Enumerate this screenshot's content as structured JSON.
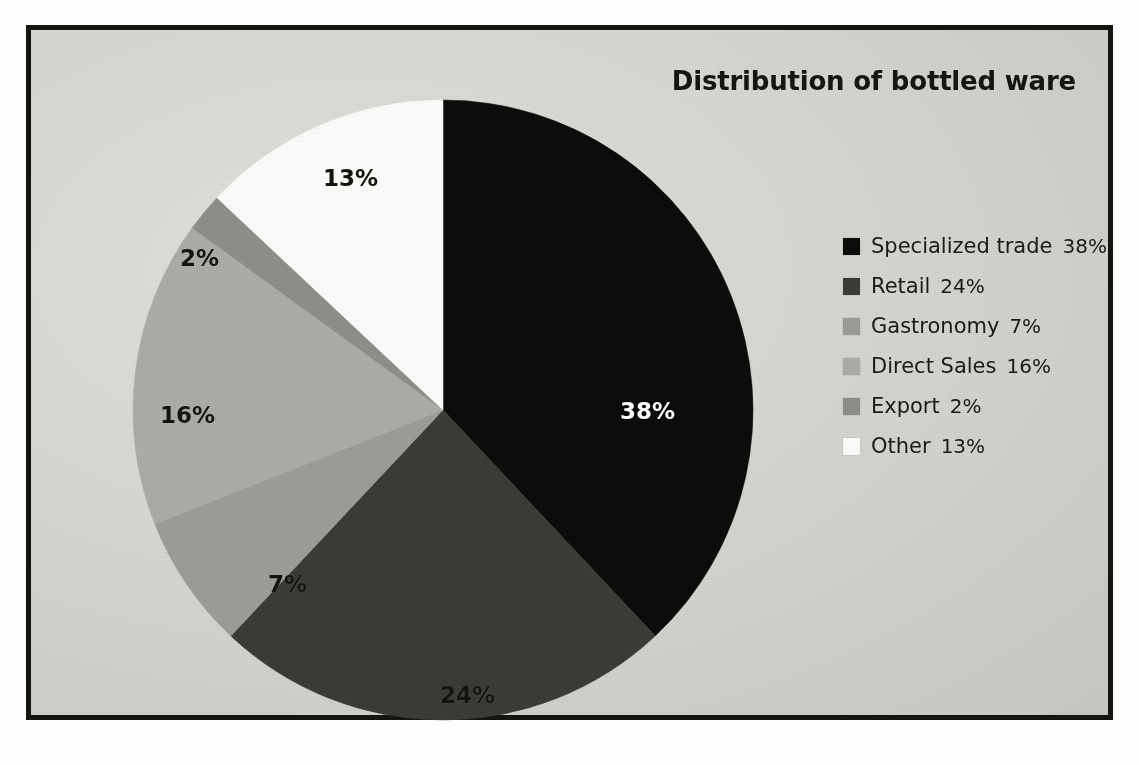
{
  "chart_data": {
    "type": "pie",
    "title": "Distribution of bottled ware",
    "xlabel": "",
    "ylabel": "",
    "legend_position": "right",
    "grid": false,
    "unit": "%",
    "start_angle_deg": 0,
    "direction": "clockwise",
    "categories": [
      "Specialized trade",
      "Retail",
      "Gastronomy",
      "Direct Sales",
      "Export",
      "Other"
    ],
    "values": [
      38,
      24,
      7,
      16,
      2,
      13
    ],
    "value_labels": [
      "38%",
      "24%",
      "7%",
      "16%",
      "2%",
      "13%"
    ],
    "colors": [
      "#0d0c0a",
      "#3b3b38",
      "#9d9d99",
      "#adada9",
      "#8f8f8b",
      "#fdfdfb"
    ],
    "label_text_colors": [
      "#ffffff",
      "#15130e",
      "#15130e",
      "#15130e",
      "#15130e",
      "#15130e"
    ],
    "slices": [
      {
        "name": "Specialized trade",
        "value": 38,
        "label": "38%",
        "color": "#0d0c0a",
        "label_color": "white"
      },
      {
        "name": "Retail",
        "value": 24,
        "label": "24%",
        "color": "#3b3b38",
        "label_color": "dark"
      },
      {
        "name": "Gastronomy",
        "value": 7,
        "label": "7%",
        "color": "#9d9d99",
        "label_color": "dark"
      },
      {
        "name": "Direct Sales",
        "value": 16,
        "label": "16%",
        "color": "#adada9",
        "label_color": "dark"
      },
      {
        "name": "Export",
        "value": 2,
        "label": "2%",
        "color": "#8f8f8b",
        "label_color": "dark"
      },
      {
        "name": "Other",
        "value": 13,
        "label": "13%",
        "color": "#fdfdfb",
        "label_color": "dark"
      }
    ]
  },
  "title": {
    "text": "Distribution of bottled ware"
  },
  "legend": {
    "items": [
      {
        "label": "Specialized trade",
        "value": "38%",
        "color": "#0d0c0a"
      },
      {
        "label": "Retail",
        "value": "24%",
        "color": "#3b3b38"
      },
      {
        "label": "Gastronomy",
        "value": "7%",
        "color": "#9d9d99"
      },
      {
        "label": "Direct Sales",
        "value": "16%",
        "color": "#adada9"
      },
      {
        "label": "Export",
        "value": "2%",
        "color": "#8f8f8b"
      },
      {
        "label": "Other",
        "value": "13%",
        "color": "#fdfdfb"
      }
    ]
  },
  "slice_labels": [
    {
      "text": "38%",
      "tone": "light",
      "left": 497,
      "top": 308
    },
    {
      "text": "24%",
      "tone": "dark",
      "left": 317,
      "top": 592
    },
    {
      "text": "7%",
      "tone": "dark",
      "left": 145,
      "top": 481
    },
    {
      "text": "16%",
      "tone": "dark",
      "left": 37,
      "top": 312
    },
    {
      "text": "2%",
      "tone": "dark",
      "left": 57,
      "top": 155
    },
    {
      "text": "13%",
      "tone": "dark",
      "left": 200,
      "top": 75
    }
  ]
}
